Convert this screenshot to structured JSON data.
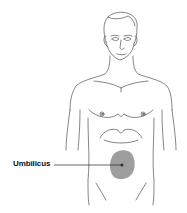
{
  "diagram": {
    "labels": [
      {
        "text": "Umbilicus",
        "target": "umbilicus"
      }
    ],
    "highlight": {
      "region": "periumbilical",
      "color": "#9a9a9a"
    },
    "colors": {
      "outline": "#333333",
      "shade": "#9e9e9e",
      "background": "#ffffff"
    }
  }
}
